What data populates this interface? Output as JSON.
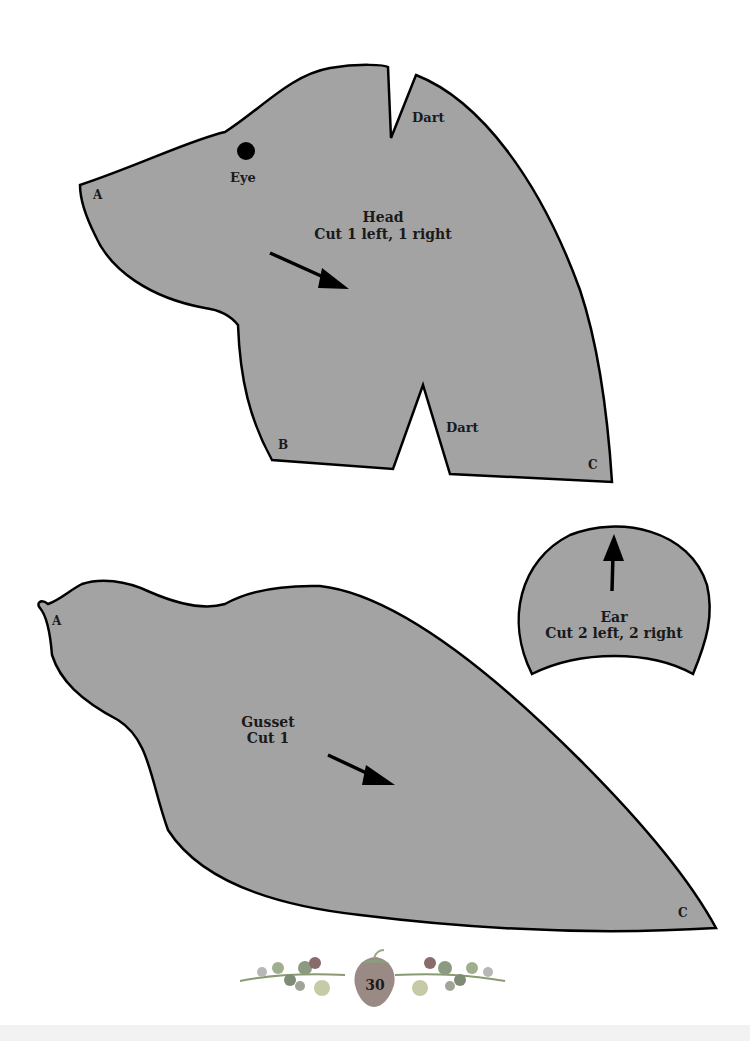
{
  "page": {
    "background": "#ffffff",
    "piece_fill": "#a3a3a3",
    "outline": "#000000",
    "page_number": "30"
  },
  "head": {
    "title": "Head",
    "instruction": "Cut 1 left, 1 right",
    "eye_label": "Eye",
    "dart_top_label": "Dart",
    "dart_bottom_label": "Dart",
    "point_a": "A",
    "point_b": "B",
    "point_c": "C"
  },
  "ear": {
    "title": "Ear",
    "instruction": "Cut 2 left, 2 right"
  },
  "gusset": {
    "title": "Gusset",
    "instruction": "Cut 1",
    "point_a": "A",
    "point_c": "C"
  }
}
